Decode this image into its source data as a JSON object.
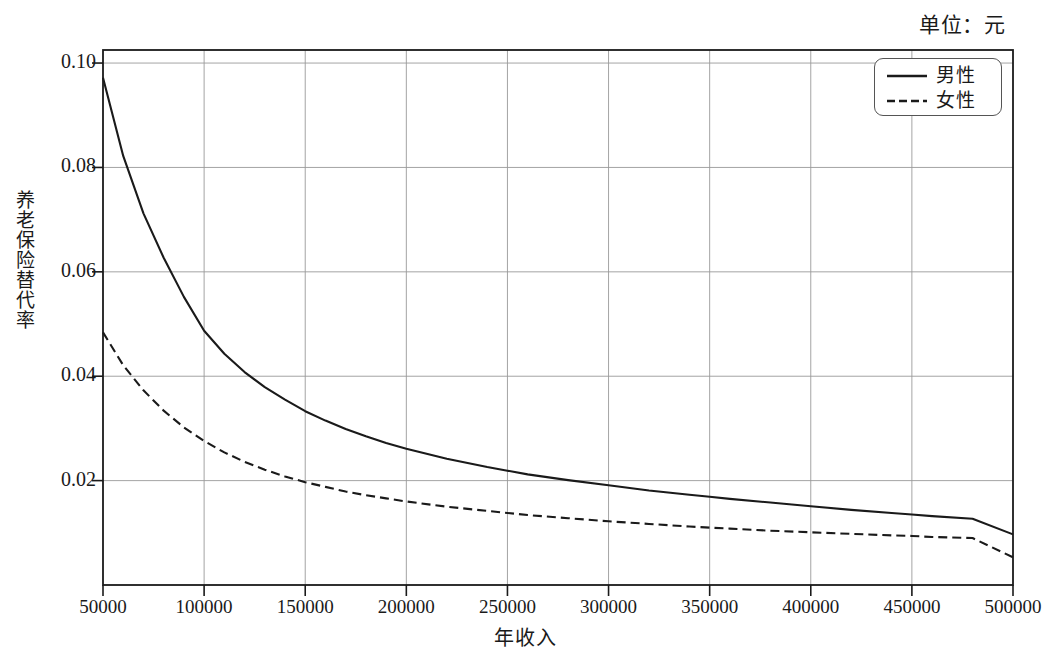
{
  "figure": {
    "unit_note": "单位：元",
    "plot": {
      "left_px": 103,
      "right_px": 1013,
      "top_px": 50,
      "bottom_px": 585
    }
  },
  "legend": {
    "position": "top-right inside plot",
    "items": [
      {
        "label": "男性",
        "style": "solid",
        "color": "#1a1a1a"
      },
      {
        "label": "女性",
        "style": "dashed",
        "color": "#1a1a1a"
      }
    ]
  },
  "chart_data": {
    "type": "line",
    "title": "",
    "subtitle": "",
    "annotations": [
      "单位：元"
    ],
    "xlabel": "年收入",
    "ylabel": "养老保险替代率",
    "xlim": [
      50000,
      500000
    ],
    "ylim": [
      0.0,
      0.1025
    ],
    "grid": true,
    "legend_position": "top-right",
    "xticks": [
      50000,
      100000,
      150000,
      200000,
      250000,
      300000,
      350000,
      400000,
      450000,
      500000
    ],
    "xtick_labels": [
      "50000",
      "100000",
      "150000",
      "200000",
      "250000",
      "300000",
      "350000",
      "400000",
      "450000",
      "500000"
    ],
    "yticks": [
      0.02,
      0.04,
      0.06,
      0.08,
      0.1
    ],
    "ytick_labels": [
      "0.02",
      "0.04",
      "0.06",
      "0.08",
      "0.10"
    ],
    "x": [
      50000,
      60000,
      70000,
      80000,
      90000,
      100000,
      110000,
      120000,
      130000,
      140000,
      150000,
      160000,
      170000,
      180000,
      190000,
      200000,
      220000,
      240000,
      250000,
      260000,
      280000,
      300000,
      320000,
      340000,
      350000,
      360000,
      380000,
      400000,
      420000,
      440000,
      450000,
      460000,
      480000,
      500000
    ],
    "series": [
      {
        "name": "男性",
        "style": "solid",
        "values": [
          0.0972,
          0.0822,
          0.0712,
          0.0627,
          0.0552,
          0.0487,
          0.0443,
          0.0408,
          0.0379,
          0.0355,
          0.0333,
          0.0315,
          0.0299,
          0.0285,
          0.0272,
          0.0261,
          0.0242,
          0.0226,
          0.0219,
          0.0212,
          0.0201,
          0.0191,
          0.0181,
          0.0173,
          0.0169,
          0.0165,
          0.0158,
          0.0151,
          0.0144,
          0.0138,
          0.0135,
          0.0132,
          0.0127,
          0.0097
        ]
      },
      {
        "name": "女性",
        "style": "dashed",
        "values": [
          0.0484,
          0.0421,
          0.0373,
          0.0334,
          0.0302,
          0.0276,
          0.0254,
          0.0236,
          0.0221,
          0.0208,
          0.0197,
          0.0188,
          0.0179,
          0.0172,
          0.0166,
          0.016,
          0.015,
          0.0142,
          0.0138,
          0.0134,
          0.0128,
          0.0122,
          0.0117,
          0.0112,
          0.011,
          0.0108,
          0.0104,
          0.0101,
          0.0098,
          0.0095,
          0.0094,
          0.0092,
          0.009,
          0.0053
        ]
      }
    ]
  }
}
